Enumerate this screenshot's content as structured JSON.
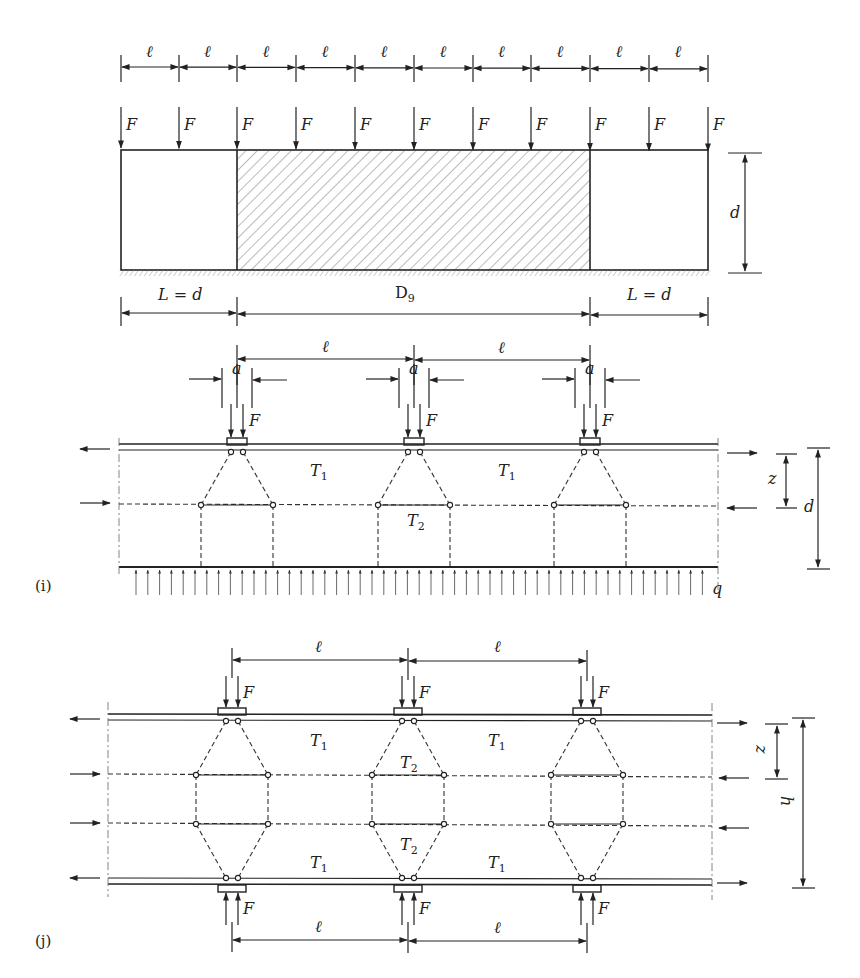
{
  "figure": {
    "top": {
      "spacing_label": "ℓ",
      "spacing_count": 10,
      "tick_x": [
        121,
        179,
        237,
        296,
        355,
        414,
        473,
        531,
        590,
        649,
        708
      ],
      "force_label": "F",
      "force_count": 11,
      "depth_label": "d",
      "left_span_label": "L = d",
      "middle_span_label": "D",
      "middle_span_subscript": "9",
      "right_span_label": "L = d"
    },
    "panel_i": {
      "label": "(i)",
      "spacing_label": "ℓ",
      "plate_width_label": "a",
      "force_label": "F",
      "tie_top_label": "T",
      "tie_top_subscript": "1",
      "tie_mid_label": "T",
      "tie_mid_subscript": "2",
      "lever_arm_label": "z",
      "depth_label": "d",
      "distributed_load_label": "q",
      "node_x": [
        237,
        414,
        590
      ]
    },
    "panel_j": {
      "label": "(j)",
      "spacing_label": "ℓ",
      "force_label": "F",
      "tie_outer_label": "T",
      "tie_outer_subscript": "1",
      "tie_inner_label": "T",
      "tie_inner_subscript": "2",
      "lever_arm_label": "z",
      "height_label": "h",
      "node_x": [
        232,
        408,
        587
      ]
    }
  }
}
